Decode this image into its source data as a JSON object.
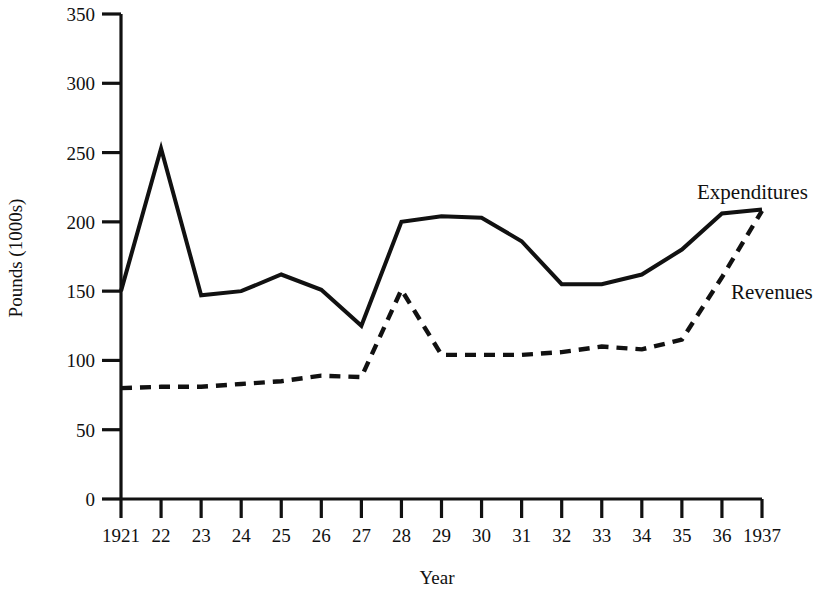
{
  "chart_data": {
    "type": "line",
    "title": "",
    "xlabel": "Year",
    "ylabel": "Pounds (1000s)",
    "x": [
      1921,
      1922,
      1923,
      1924,
      1925,
      1926,
      1927,
      1928,
      1929,
      1930,
      1931,
      1932,
      1933,
      1934,
      1935,
      1936,
      1937
    ],
    "x_tick_labels": [
      "1921",
      "22",
      "23",
      "24",
      "25",
      "26",
      "27",
      "28",
      "29",
      "30",
      "31",
      "32",
      "33",
      "34",
      "35",
      "36",
      "1937"
    ],
    "y_tick_labels": [
      "0",
      "50",
      "100",
      "150",
      "200",
      "250",
      "300",
      "350"
    ],
    "y_ticks": [
      0,
      50,
      100,
      150,
      200,
      250,
      300,
      350
    ],
    "ylim": [
      0,
      350
    ],
    "xlim": [
      1921,
      1937
    ],
    "grid": false,
    "legend_position": "inline-right",
    "series": [
      {
        "name": "Expenditures",
        "style": "solid",
        "color": "#111111",
        "values": [
          150,
          253,
          147,
          150,
          162,
          151,
          125,
          200,
          204,
          203,
          186,
          155,
          155,
          162,
          180,
          206,
          209
        ]
      },
      {
        "name": "Revenues",
        "style": "dashed",
        "color": "#111111",
        "values": [
          80,
          81,
          81,
          83,
          85,
          89,
          88,
          151,
          104,
          104,
          104,
          106,
          110,
          108,
          115,
          160,
          208
        ]
      }
    ],
    "annotations": [
      {
        "text": "Expenditures",
        "series": "Expenditures"
      },
      {
        "text": "Revenues",
        "series": "Revenues"
      }
    ]
  },
  "axes": {
    "y_axis_label": "Pounds (1000s)",
    "x_axis_label": "Year"
  }
}
